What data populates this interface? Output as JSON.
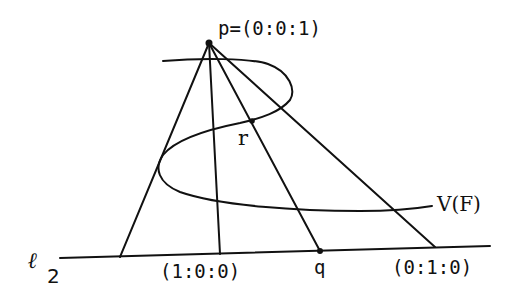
{
  "diagram": {
    "type": "projective-geometry-projection",
    "labels": {
      "p": "p=(0:0:1)",
      "r": "r",
      "curve": "V(F)",
      "line_letter": "ℓ",
      "line_sub": "2",
      "x_point": "(1:0:0)",
      "q": "q",
      "y_point": "(0:1:0)"
    },
    "points": {
      "p": [
        209,
        43
      ],
      "r": [
        252,
        121
      ],
      "q": [
        320,
        251
      ]
    },
    "line_l2": {
      "from": [
        60,
        258
      ],
      "to": [
        490,
        246
      ]
    },
    "rays_from_p": [
      {
        "to": [
          120,
          257
        ]
      },
      {
        "to": [
          220,
          254
        ]
      },
      {
        "to": [
          320,
          251
        ]
      },
      {
        "to": [
          435,
          247
        ]
      }
    ],
    "stroke_color": "#111111"
  }
}
